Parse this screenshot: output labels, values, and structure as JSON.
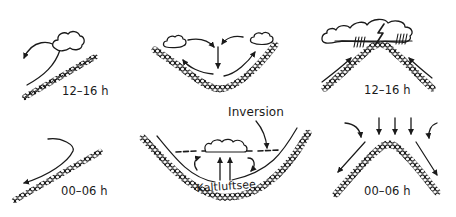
{
  "diagram": {
    "panels": [
      {
        "id": "slope-day",
        "row": 1,
        "col": 1,
        "time_label": "12–16 h",
        "terrain": "slope",
        "description": "upslope wind rising to a cumulus cloud"
      },
      {
        "id": "valley-day",
        "row": 1,
        "col": 2,
        "time_label": "",
        "terrain": "valley",
        "description": "upslope winds on both sides, two cumulus clouds, subsiding air in the center"
      },
      {
        "id": "ridge-day",
        "row": 1,
        "col": 3,
        "time_label": "12–16 h",
        "terrain": "ridge",
        "description": "upslope winds converge at summit forming a thunderstorm cloud with lightning and rain"
      },
      {
        "id": "slope-night",
        "row": 2,
        "col": 1,
        "time_label": "00–06 h",
        "terrain": "slope",
        "description": "downslope wind flowing down the slope"
      },
      {
        "id": "valley-night",
        "row": 2,
        "col": 2,
        "time_label": "",
        "terrain": "valley",
        "description": "cold air pool in valley bottom under an inversion layer with a stratus cloud",
        "labels": {
          "inversion": "Inversion",
          "cold_air_pool": "Kaltluftsee"
        }
      },
      {
        "id": "ridge-night",
        "row": 2,
        "col": 3,
        "time_label": "00–06 h",
        "terrain": "ridge",
        "description": "downslope winds on both sides with subsiding air from above"
      }
    ]
  },
  "colors": {
    "ink": "#1a1a1a",
    "background": "#ffffff"
  }
}
